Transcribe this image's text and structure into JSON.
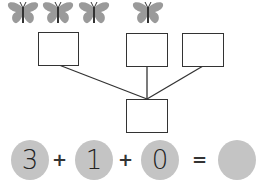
{
  "butterflies": {
    "groups": [
      {
        "count": 3,
        "centers_x": [
          23,
          58,
          94
        ]
      },
      {
        "count": 1,
        "centers_x": [
          148
        ]
      }
    ],
    "color": "#9a9a9a",
    "icon": "butterfly-icon"
  },
  "number_bond": {
    "top_boxes": [
      "",
      "",
      ""
    ],
    "bottom_box": ""
  },
  "equation": {
    "terms": [
      "3",
      "1",
      "0"
    ],
    "operators": [
      "+",
      "+",
      "="
    ],
    "result": "",
    "circle_color": "#c4c4c4"
  }
}
